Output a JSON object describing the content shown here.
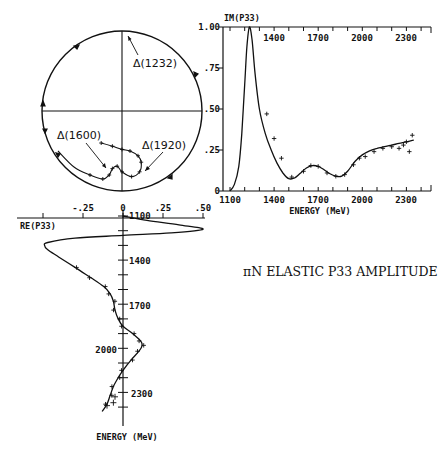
{
  "figure": {
    "title": "πN ELASTIC P33 AMPLITUDE"
  },
  "chart_data": [
    {
      "id": "im",
      "type": "line",
      "title": "",
      "ylabel": "IM(P33)",
      "xlabel": "ENERGY (MeV)",
      "xlim": [
        1100,
        2450
      ],
      "ylim": [
        0,
        1.0
      ],
      "x_ticks": [
        1100,
        1400,
        1700,
        2000,
        2300
      ],
      "y_ticks": [
        0,
        0.25,
        0.5,
        0.75,
        1.0
      ],
      "y_tick_labels": [
        "0",
        ".25",
        ".50",
        ".75",
        "1.00"
      ],
      "grid": false,
      "series": [
        {
          "name": "fit",
          "x": [
            1100,
            1130,
            1160,
            1180,
            1200,
            1215,
            1232,
            1250,
            1270,
            1300,
            1340,
            1380,
            1420,
            1460,
            1500,
            1540,
            1580,
            1620,
            1660,
            1700,
            1740,
            1780,
            1820,
            1860,
            1900,
            1950,
            2000,
            2050,
            2100,
            2150,
            2200,
            2250,
            2300,
            2350
          ],
          "y": [
            0.0,
            0.04,
            0.15,
            0.35,
            0.65,
            0.88,
            1.0,
            0.92,
            0.72,
            0.5,
            0.35,
            0.25,
            0.17,
            0.11,
            0.075,
            0.08,
            0.11,
            0.14,
            0.155,
            0.15,
            0.13,
            0.105,
            0.09,
            0.09,
            0.12,
            0.18,
            0.22,
            0.245,
            0.26,
            0.27,
            0.28,
            0.29,
            0.3,
            0.31
          ]
        },
        {
          "name": "data",
          "x": [
            1350,
            1400,
            1450,
            1520,
            1600,
            1650,
            1700,
            1760,
            1820,
            1880,
            1940,
            1980,
            2020,
            2080,
            2140,
            2200,
            2250,
            2280,
            2300,
            2320,
            2340
          ],
          "y": [
            0.47,
            0.32,
            0.2,
            0.085,
            0.12,
            0.155,
            0.15,
            0.11,
            0.09,
            0.1,
            0.16,
            0.2,
            0.21,
            0.24,
            0.26,
            0.27,
            0.26,
            0.28,
            0.3,
            0.24,
            0.34
          ]
        }
      ]
    },
    {
      "id": "re",
      "type": "line",
      "xlabel": "RE(P33)",
      "ylabel": "ENERGY (MeV)",
      "xlim": [
        -0.5,
        0.5
      ],
      "ylim": [
        1100,
        2450
      ],
      "x_ticks": [
        -0.25,
        0,
        0.25,
        0.5
      ],
      "x_tick_labels": [
        "-.25",
        "0",
        ".25",
        ".50"
      ],
      "y_ticks": [
        1100,
        1400,
        1700,
        2000,
        2300
      ],
      "orientation": "energy on vertical axis, increasing downward",
      "series": [
        {
          "name": "fit",
          "energy": [
            1100,
            1130,
            1160,
            1190,
            1215,
            1232,
            1250,
            1280,
            1300,
            1330,
            1380,
            1450,
            1520,
            1580,
            1630,
            1680,
            1740,
            1800,
            1850,
            1900,
            1950,
            1980,
            2020,
            2080,
            2150,
            2200,
            2260,
            2320,
            2380,
            2430
          ],
          "re": [
            0.0,
            0.15,
            0.35,
            0.5,
            0.3,
            0.0,
            -0.3,
            -0.47,
            -0.49,
            -0.47,
            -0.4,
            -0.3,
            -0.2,
            -0.12,
            -0.08,
            -0.06,
            -0.05,
            -0.03,
            0.0,
            0.06,
            0.11,
            0.12,
            0.1,
            0.05,
            0.0,
            -0.03,
            -0.06,
            -0.08,
            -0.1,
            -0.13
          ]
        }
      ]
    },
    {
      "id": "argand",
      "type": "scatter",
      "description": "Argand (unitarity circle) plot of P33 amplitude",
      "xlim": [
        -0.5,
        0.5
      ],
      "ylim": [
        0,
        1.0
      ],
      "annotations": [
        "Δ(1232)",
        "Δ(1600)",
        "Δ(1920)"
      ],
      "series": [
        {
          "name": "trajectory",
          "re": [
            0.0,
            0.3,
            0.5,
            0.3,
            0.0,
            -0.3,
            -0.47,
            -0.49,
            -0.4,
            -0.3,
            -0.2,
            -0.12,
            -0.08,
            -0.06,
            -0.03,
            0.0,
            0.06,
            0.11,
            0.12,
            0.1,
            0.05,
            0.0,
            -0.06,
            -0.13
          ],
          "im": [
            0.0,
            0.1,
            0.5,
            0.9,
            1.0,
            0.9,
            0.6,
            0.45,
            0.25,
            0.15,
            0.1,
            0.075,
            0.1,
            0.14,
            0.155,
            0.12,
            0.09,
            0.12,
            0.18,
            0.22,
            0.25,
            0.26,
            0.28,
            0.3
          ]
        }
      ]
    }
  ],
  "labels": {
    "im_axis_title": "IM(P33)",
    "re_axis_title": "RE(P33)",
    "im_energy_label": "ENERGY (MeV)",
    "re_energy_label": "ENERGY (MeV)",
    "delta1232": "Δ(1232)",
    "delta1600": "Δ(1600)",
    "delta1920": "Δ(1920)",
    "im_y_ticks": [
      "0",
      ".25",
      ".50",
      ".75",
      "1.00"
    ],
    "im_x_ticks": [
      "1100",
      "1400",
      "1700",
      "2000",
      "2300"
    ],
    "re_x_ticks": [
      "-.25",
      "0",
      ".25",
      ".50"
    ],
    "re_e_ticks": [
      "1100",
      "1400",
      "1700",
      "2000",
      "2300"
    ]
  }
}
